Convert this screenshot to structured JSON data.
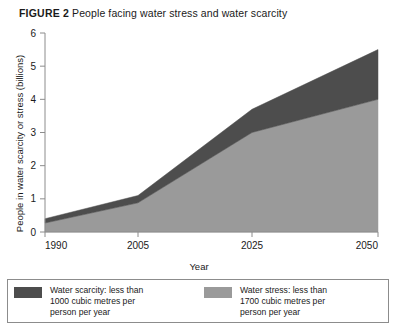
{
  "figure": {
    "label": "FIGURE 2",
    "caption": "People facing water stress and water scarcity"
  },
  "axes": {
    "x_title": "Year",
    "y_title": "People in water scarcity or stress (billions)",
    "x_ticks": [
      "1990",
      "2005",
      "2025",
      "2050"
    ],
    "y_ticks": [
      "0",
      "1",
      "2",
      "3",
      "4",
      "5",
      "6"
    ]
  },
  "legend": {
    "scarcity": {
      "swatch_color": "#4d4d4d",
      "text": "Water scarcity: less than\n1000 cubic metres per\nperson per year"
    },
    "stress": {
      "swatch_color": "#9a9a9a",
      "text": "Water stress: less than\n1700 cubic metres per\nperson per year"
    }
  },
  "chart_data": {
    "type": "area",
    "title": "People facing water stress and water scarcity",
    "xlabel": "Year",
    "ylabel": "People in water scarcity or stress (billions)",
    "x": [
      1990,
      2005,
      2025,
      2050
    ],
    "xtick_labels": [
      "1990",
      "2005",
      "2025",
      "2050"
    ],
    "xtick_positions_px": [
      45,
      138,
      252,
      378
    ],
    "xlim": [
      1990,
      2050
    ],
    "ylim": [
      0,
      6
    ],
    "ytick_labels": [
      "0",
      "1",
      "2",
      "3",
      "4",
      "5",
      "6"
    ],
    "ytick_values": [
      0,
      1,
      2,
      3,
      4,
      5,
      6
    ],
    "grid": false,
    "stacked": true,
    "legend_position": "below",
    "series": [
      {
        "name": "Water stress: less than 1700 cubic metres per person per year",
        "color": "#9a9a9a",
        "values": [
          0.27,
          0.88,
          3.0,
          4.0
        ]
      },
      {
        "name": "Water scarcity: less than 1000 cubic metres per person per year",
        "color": "#4d4d4d",
        "values": [
          0.13,
          0.22,
          0.7,
          1.5
        ]
      }
    ],
    "cumulative_top": [
      0.4,
      1.1,
      3.7,
      5.5
    ]
  },
  "style": {
    "axis_color": "#8c8c8c",
    "text_color": "#1a1a1a",
    "background": "#ffffff"
  }
}
